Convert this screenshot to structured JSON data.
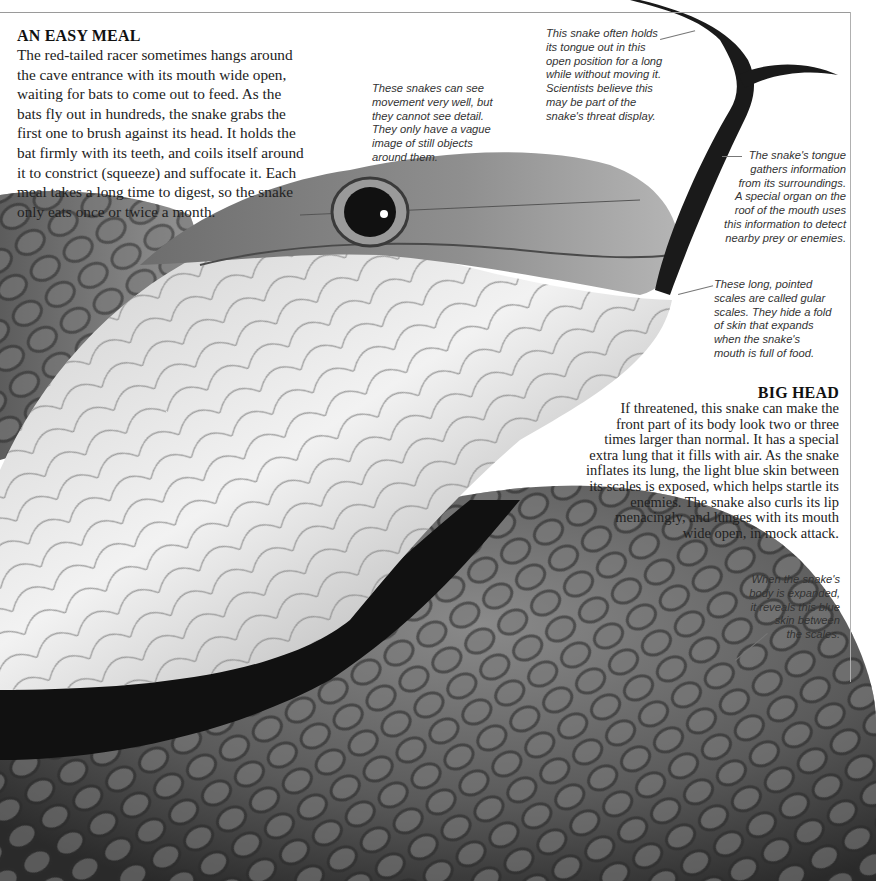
{
  "page": {
    "page_number": "29",
    "colors": {
      "background": "#ffffff",
      "text": "#222222",
      "frame": "#9a9a9a"
    }
  },
  "easy_meal": {
    "heading": "AN EASY MEAL",
    "lines": [
      "The red-tailed racer sometimes hangs around",
      "the cave entrance with its mouth wide open,",
      "waiting for bats to come out to feed. As the",
      "bats fly out in hundreds, the snake grabs the",
      "first one to brush against its head. It holds the",
      "bat firmly with its teeth, and coils itself around",
      "it to constrict (squeeze) and suffocate it. Each",
      "meal takes a long time to digest, so the snake",
      "only eats once or twice a month."
    ]
  },
  "big_head": {
    "heading": "BIG HEAD",
    "lines": [
      "If threatened, this snake can make the",
      "front part of its body look two or three",
      "times larger than normal. It has a special",
      "extra lung that it fills with air. As the snake",
      "inflates its lung, the light blue skin between",
      "its scales is exposed, which helps startle its",
      "enemies. The snake also curls its lip",
      "menacingly, and lunges with its mouth",
      "wide open, in mock attack."
    ]
  },
  "captions": {
    "eyes": [
      "These snakes can see",
      "movement very well, but",
      "they cannot see detail.",
      "They only have a vague",
      "image of still objects",
      "around them."
    ],
    "tongue_hold": [
      "This snake often holds",
      "its tongue out in this",
      "open position for a long",
      "while without moving it.",
      "Scientists believe this",
      "may be part of the",
      "snake's threat display."
    ],
    "tongue_info": [
      "The snake's tongue",
      "gathers information",
      "from its surroundings.",
      "A special organ on the",
      "roof of the mouth uses",
      "this information to detect",
      "nearby prey or enemies."
    ],
    "gular": [
      "These long, pointed",
      "scales are called gular",
      "scales. They hide a fold",
      "of skin that expands",
      "when the snake's",
      "mouth is full of food."
    ],
    "blue_skin": [
      "When the snake's",
      "body is expanded,",
      "it reveals this blue",
      "skin between",
      "the scales."
    ]
  },
  "photo": {
    "subject": "red-tailed racer snake head with tongue extended",
    "icon": "snake-photo"
  }
}
